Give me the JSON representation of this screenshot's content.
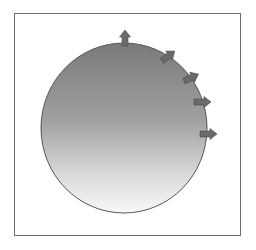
{
  "diagram": {
    "type": "sphere-with-outward-arrows",
    "frame": {
      "border_color": "#6e6e6e"
    },
    "sphere": {
      "cx": 124,
      "cy": 128,
      "rx": 83,
      "ry": 85,
      "stroke": "#555555",
      "gradient_top": "#7a7a7a",
      "gradient_mid": "#a8a8a8",
      "gradient_bottom": "#f6f6f6"
    },
    "arrows": [
      {
        "x": 125,
        "y": 44,
        "angle": -90
      },
      {
        "x": 165,
        "y": 55,
        "angle": -38
      },
      {
        "x": 188,
        "y": 77,
        "angle": -25
      },
      {
        "x": 199,
        "y": 102,
        "angle": 0
      },
      {
        "x": 205,
        "y": 134,
        "angle": 0
      }
    ],
    "arrow_color": "#6a6a6a",
    "arrow_stroke": "#4a4a4a"
  },
  "caption": {
    "text": ""
  }
}
